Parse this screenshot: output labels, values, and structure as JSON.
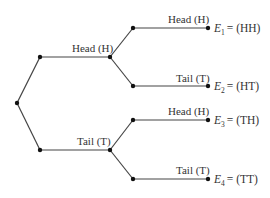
{
  "diagram": {
    "type": "tree",
    "title": "",
    "first_toss": {
      "head_label": "Head (H)",
      "tail_label": "Tail (T)"
    },
    "second_toss": [
      {
        "label": "Head (H)",
        "event_symbol": "E",
        "event_sub": "1",
        "event_value": "= (HH)"
      },
      {
        "label": "Tail (T)",
        "event_symbol": "E",
        "event_sub": "2",
        "event_value": "= (HT)"
      },
      {
        "label": "Head (H)",
        "event_symbol": "E",
        "event_sub": "3",
        "event_value": "= (TH)"
      },
      {
        "label": "Tail (T)",
        "event_symbol": "E",
        "event_sub": "4",
        "event_value": "= (TT)"
      }
    ]
  }
}
